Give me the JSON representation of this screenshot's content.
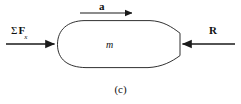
{
  "figure": {
    "caption": "(c)",
    "background_color": "#ffffff",
    "stroke_color": "#1a1a1a",
    "body_fill": "#ffffff"
  },
  "labels": {
    "acceleration": "a",
    "sum_forces_sigma": "Σ",
    "sum_forces_symbol": "F",
    "sum_forces_subscript": "x",
    "resistance": "R",
    "mass": "m"
  },
  "vectors": [
    {
      "name": "acceleration-vector",
      "label": "a",
      "direction": "right",
      "x_start": 80,
      "x_end": 135,
      "y": 13
    },
    {
      "name": "applied-force-vector",
      "label": "Σ Fx",
      "direction": "right",
      "x_start": 6,
      "x_end": 57,
      "y": 44
    },
    {
      "name": "resistance-vector",
      "label": "R",
      "direction": "left",
      "x_start": 235,
      "x_end": 180,
      "y": 44
    }
  ]
}
